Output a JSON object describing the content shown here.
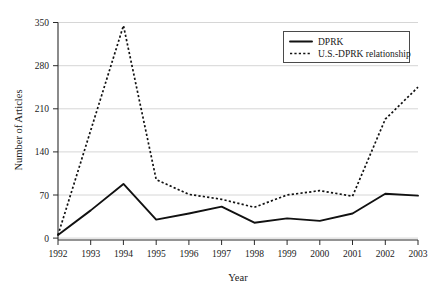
{
  "chart_data": {
    "type": "line",
    "title": "",
    "xlabel": "Year",
    "ylabel": "Number of Articles",
    "categories": [
      "1992",
      "1993",
      "1994",
      "1995",
      "1996",
      "1997",
      "1998",
      "1999",
      "2000",
      "2001",
      "2002",
      "2003"
    ],
    "x": [
      1992,
      1993,
      1994,
      1995,
      1996,
      1997,
      1998,
      1999,
      2000,
      2001,
      2002,
      2003
    ],
    "series": [
      {
        "name": "DPRK",
        "style": "solid",
        "color": "#111111",
        "values": [
          5,
          45,
          88,
          30,
          40,
          51,
          25,
          32,
          28,
          40,
          72,
          69
        ]
      },
      {
        "name": "U.S.-DPRK relationship",
        "style": "dotted",
        "color": "#111111",
        "values": [
          5,
          175,
          345,
          95,
          71,
          63,
          50,
          70,
          77,
          68,
          193,
          245
        ]
      }
    ],
    "yticks": [
      0,
      70,
      140,
      210,
      280,
      350
    ],
    "ytick_labels": [
      "0",
      "70",
      "140",
      "210",
      "280",
      "350"
    ],
    "ylim": [
      0,
      350
    ],
    "xlim": [
      1992,
      2003
    ],
    "grid": true,
    "grid_axis": "y",
    "legend_position": "top-right",
    "legend_entries": [
      "DPRK",
      "U.S.-DPRK relationship"
    ]
  },
  "axis": {
    "y_title": "Number of Articles",
    "x_title": "Year"
  },
  "legend": {
    "item_1": "DPRK",
    "item_2": "U.S.-DPRK relationship"
  },
  "yticks": {
    "t0": "0",
    "t1": "70",
    "t2": "140",
    "t3": "210",
    "t4": "280",
    "t5": "350"
  },
  "xticks": {
    "t0": "1992",
    "t1": "1993",
    "t2": "1994",
    "t3": "1995",
    "t4": "1996",
    "t5": "1997",
    "t6": "1998",
    "t7": "1999",
    "t8": "2000",
    "t9": "2001",
    "t10": "2002",
    "t11": "2003"
  }
}
